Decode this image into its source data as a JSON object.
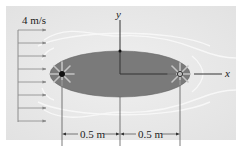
{
  "diagram": {
    "velocity_label": "4 m/s",
    "x_axis_label": "x",
    "y_axis_label": "y",
    "dim_left": "0.5 m",
    "dim_right": "0.5 m",
    "arrow_count": 8,
    "colors": {
      "background_panel": "#ebebeb",
      "body_fill": "#7a7a7a",
      "body_stroke": "#5a5a5a",
      "axis": "#333333",
      "flow_arrows": "#888888",
      "streamlines": "#f7f7f7",
      "source_dot": "#111111",
      "sink_ring": "#444444",
      "rays": "#c8c8c8"
    }
  }
}
